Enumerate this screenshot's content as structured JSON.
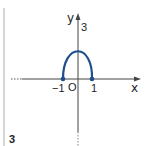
{
  "diagram": {
    "panel_number": "3",
    "axes": {
      "x_label": "x",
      "y_label": "y",
      "origin_label": "O"
    },
    "tick_labels": {
      "x_neg": "−1",
      "x_pos": "1",
      "y_top": "3"
    },
    "curve": {
      "description": "arch from (-1,0) to (1,0) with maximum at (0,3)",
      "color": "#1f4e8c",
      "endpoints": [
        [
          -1,
          0
        ],
        [
          1,
          0
        ]
      ],
      "vertex": [
        0,
        3
      ]
    },
    "colors": {
      "axis": "#444444",
      "divider": "#bbbbbb",
      "curve": "#1f4e8c"
    }
  }
}
